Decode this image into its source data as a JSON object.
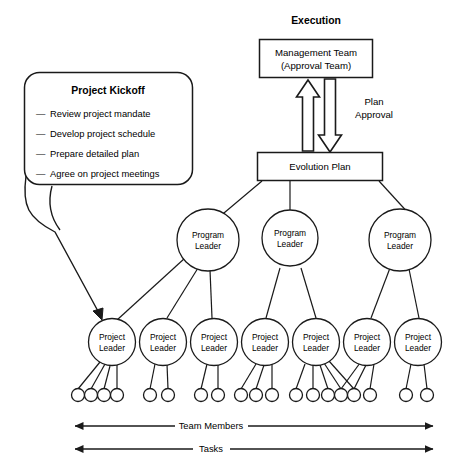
{
  "diagram": {
    "title_execution": "Execution",
    "callout": {
      "heading": "Project Kickoff",
      "items": [
        "Review project mandate",
        "Develop project schedule",
        "Prepare detailed plan",
        "Agree on project meetings"
      ],
      "bullet_glyph": "—"
    },
    "boxes": {
      "management_team_line1": "Management Team",
      "management_team_line2": "(Approval Team)",
      "evolution_plan": "Evolution Plan"
    },
    "arrow_label": {
      "line1": "Plan",
      "line2": "Approval"
    },
    "program_leaders": [
      {
        "line1": "Program",
        "line2": "Leader"
      },
      {
        "line1": "Program",
        "line2": "Leader"
      },
      {
        "line1": "Program",
        "line2": "Leader"
      }
    ],
    "project_leaders": [
      {
        "line1": "Project",
        "line2": "Leader"
      },
      {
        "line1": "Project",
        "line2": "Leader"
      },
      {
        "line1": "Project",
        "line2": "Leader"
      },
      {
        "line1": "Project",
        "line2": "Leader"
      },
      {
        "line1": "Project",
        "line2": "Leader"
      },
      {
        "line1": "Project",
        "line2": "Leader"
      },
      {
        "line1": "Project",
        "line2": "Leader"
      }
    ],
    "team_member_counts": [
      4,
      2,
      2,
      3,
      5,
      3,
      2
    ],
    "axis_labels": {
      "team_members": "Team Members",
      "tasks": "Tasks"
    },
    "colors": {
      "stroke": "#1a1a1a",
      "fill": "#ffffff",
      "text": "#000000"
    }
  }
}
